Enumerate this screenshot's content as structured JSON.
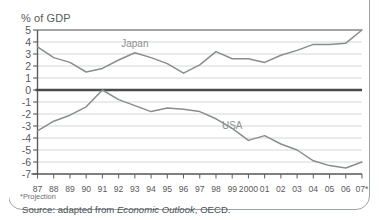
{
  "figure": {
    "axis_title": "% of GDP",
    "footnote": "*Projection",
    "source_prefix": "Source: adapted from ",
    "source_italic": "Economic Outlook",
    "source_suffix": ", OECD.",
    "colors": {
      "line": "#8a8d8f",
      "zero_line": "#4a4a4a",
      "grid": "#c9cccd",
      "axis": "#5b5d5f",
      "text": "#58595b",
      "frame": "#9aa3a8",
      "background": "#ffffff"
    }
  },
  "chart_data": {
    "type": "line",
    "title": "",
    "subtitle": "",
    "xlabel": "",
    "ylabel": "% of GDP",
    "ylim": [
      -7,
      5
    ],
    "yticks": [
      5,
      4,
      3,
      2,
      1,
      0,
      -1,
      -2,
      -3,
      -4,
      -5,
      -6,
      -7
    ],
    "ytick_labels": [
      "5",
      "4",
      "3",
      "2",
      "1",
      "0",
      "-1",
      "-2",
      "-3",
      "-4",
      "-5",
      "-6",
      "-7"
    ],
    "grid": true,
    "grid_axis": "y",
    "legend": "inline-labels",
    "x": [
      "87",
      "88",
      "89",
      "90",
      "91",
      "92",
      "93",
      "94",
      "95",
      "96",
      "97",
      "98",
      "99",
      "2000",
      "01",
      "02",
      "03",
      "04",
      "05",
      "06",
      "07*"
    ],
    "xtick_labels": [
      "87",
      "88",
      "89",
      "90",
      "91",
      "92",
      "93",
      "94",
      "95",
      "96",
      "97",
      "98",
      "99",
      "2000",
      "01",
      "02",
      "03",
      "04",
      "05",
      "06",
      "07*"
    ],
    "series": [
      {
        "name": "Japan",
        "label_x_index": 6,
        "label_y": 3.9,
        "values": [
          3.6,
          2.7,
          2.3,
          1.5,
          1.8,
          2.5,
          3.1,
          2.7,
          2.2,
          1.4,
          2.1,
          3.2,
          2.6,
          2.6,
          2.3,
          2.9,
          3.3,
          3.8,
          3.8,
          3.9,
          5.0
        ]
      },
      {
        "name": "USA",
        "label_x_index": 12,
        "label_y": -2.9,
        "values": [
          -3.4,
          -2.6,
          -2.1,
          -1.4,
          0.0,
          -0.8,
          -1.3,
          -1.8,
          -1.5,
          -1.6,
          -1.8,
          -2.4,
          -3.2,
          -4.2,
          -3.8,
          -4.5,
          -5.0,
          -5.9,
          -6.3,
          -6.5,
          -6.0
        ]
      }
    ],
    "annotations": [
      {
        "text": "*Projection",
        "role": "footnote"
      },
      {
        "text": "Source: adapted from Economic Outlook, OECD.",
        "role": "source"
      }
    ]
  }
}
